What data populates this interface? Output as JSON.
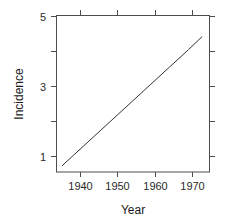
{
  "chart_data": {
    "type": "line",
    "title": "",
    "subtitle": "",
    "xlabel": "Year",
    "ylabel": "Incidence",
    "xlim": [
      1935.5,
      1975.5
    ],
    "ylim": [
      0.55,
      5.45
    ],
    "grid": false,
    "legend": null,
    "xticks": [
      1940,
      1950,
      1960,
      1970
    ],
    "xtick_labels": [
      "1940",
      "1950",
      "1960",
      "1970"
    ],
    "yticks": [
      1,
      2,
      3,
      4,
      5
    ],
    "ytick_labels": [
      "1",
      "",
      "3",
      "",
      "5"
    ],
    "ytick_labels_shown": [
      "1",
      "3",
      "5"
    ],
    "frame": "box",
    "tick_direction": "out",
    "series": [
      {
        "name": "incidence-trend",
        "color": "#333333",
        "linewidth": 1,
        "x": [
          1937.0,
          1973.5
        ],
        "y": [
          0.75,
          4.78
        ],
        "points": [
          [
            1937.0,
            0.75
          ],
          [
            1940.0,
            1.08
          ],
          [
            1945.0,
            1.63
          ],
          [
            1950.0,
            2.18
          ],
          [
            1955.0,
            2.73
          ],
          [
            1960.0,
            3.28
          ],
          [
            1965.0,
            3.83
          ],
          [
            1970.0,
            4.38
          ],
          [
            1973.5,
            4.78
          ]
        ]
      }
    ]
  },
  "axis": {
    "x_title": "Year",
    "y_title": "Incidence"
  },
  "ticks": {
    "x": [
      {
        "value": 1940,
        "label": "1940"
      },
      {
        "value": 1950,
        "label": "1950"
      },
      {
        "value": 1960,
        "label": "1960"
      },
      {
        "value": 1970,
        "label": "1970"
      }
    ],
    "y": [
      {
        "value": 5,
        "label": "5"
      },
      {
        "value": 4,
        "label": ""
      },
      {
        "value": 3,
        "label": "3"
      },
      {
        "value": 2,
        "label": ""
      },
      {
        "value": 1,
        "label": "1"
      }
    ]
  },
  "colors": {
    "background": "#ffffff",
    "axis": "#4d4d4d",
    "line": "#333333",
    "text": "#1a1a1a"
  }
}
